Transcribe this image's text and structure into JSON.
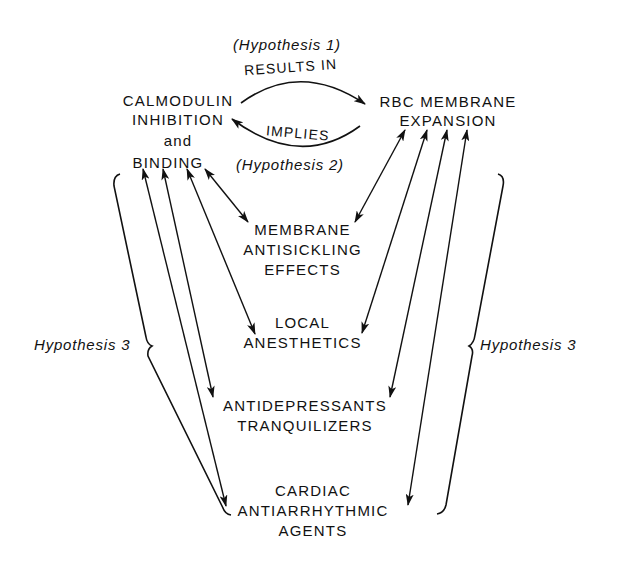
{
  "diagram": {
    "type": "concept-relationship diagram",
    "hypotheses": {
      "h1": "(Hypothesis 1)",
      "h2": "(Hypothesis 2)",
      "h3_left": "Hypothesis 3",
      "h3_right": "Hypothesis 3"
    },
    "edge_labels": {
      "results_in": "RESULTS IN",
      "implies": "IMPLIES"
    },
    "nodes": {
      "calmodulin": {
        "lines": [
          "CALMODULIN",
          "INHIBITION",
          "and",
          "BINDING"
        ]
      },
      "rbc": {
        "lines": [
          "RBC MEMBRANE",
          "EXPANSION"
        ]
      },
      "membrane_antisickling": {
        "lines": [
          "MEMBRANE",
          "ANTISICKLING",
          "EFFECTS"
        ]
      },
      "local_anesthetics": {
        "lines": [
          "LOCAL",
          "ANESTHETICS"
        ]
      },
      "antidepressants": {
        "lines": [
          "ANTIDEPRESSANTS",
          "TRANQUILIZERS"
        ]
      },
      "cardiac": {
        "lines": [
          "CARDIAC",
          "ANTIARRHYTHMIC",
          "AGENTS"
        ]
      }
    },
    "edges": [
      {
        "from": "calmodulin",
        "to": "rbc",
        "label": "RESULTS IN",
        "hypothesis": "Hypothesis 1"
      },
      {
        "from": "rbc",
        "to": "calmodulin",
        "label": "IMPLIES",
        "hypothesis": "Hypothesis 2"
      },
      {
        "from": "calmodulin",
        "to": "membrane_antisickling",
        "bidirectional": true
      },
      {
        "from": "calmodulin",
        "to": "local_anesthetics",
        "bidirectional": true
      },
      {
        "from": "calmodulin",
        "to": "antidepressants",
        "bidirectional": true
      },
      {
        "from": "calmodulin",
        "to": "cardiac",
        "bidirectional": true
      },
      {
        "from": "rbc",
        "to": "membrane_antisickling",
        "bidirectional": true
      },
      {
        "from": "rbc",
        "to": "local_anesthetics",
        "bidirectional": true
      },
      {
        "from": "rbc",
        "to": "antidepressants",
        "bidirectional": true
      },
      {
        "from": "rbc",
        "to": "cardiac",
        "bidirectional": true
      }
    ],
    "colors": {
      "ink": "#111111",
      "background": "#ffffff"
    }
  }
}
